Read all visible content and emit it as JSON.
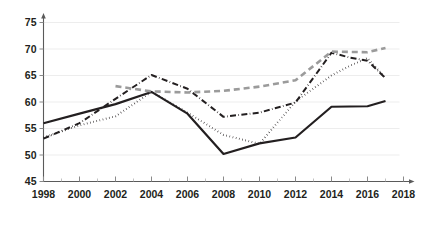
{
  "chart_data": {
    "type": "line",
    "title": "",
    "subtitle": "",
    "xlabel": "",
    "ylabel": "",
    "xlim": [
      1998,
      2018
    ],
    "ylim": [
      45,
      75
    ],
    "grid": false,
    "legend": "none",
    "x_ticks": [
      "1998",
      "2000",
      "2002",
      "2004",
      "2006",
      "2008",
      "2010",
      "2012",
      "2014",
      "2016",
      "2018"
    ],
    "x_tick_values": [
      1998,
      2000,
      2002,
      2004,
      2006,
      2008,
      2010,
      2012,
      2014,
      2016,
      2018
    ],
    "x_minor_tick_values": [
      1999,
      2001,
      2003,
      2005,
      2007,
      2009,
      2011,
      2013,
      2015,
      2017
    ],
    "y_ticks": [
      "45",
      "50",
      "55",
      "60",
      "65",
      "70",
      "75"
    ],
    "y_tick_values": [
      45,
      50,
      55,
      60,
      65,
      70,
      75
    ],
    "series": [
      {
        "name": "series-1-solid",
        "style": "solid",
        "color": "#231f20",
        "width": 2.2,
        "x": [
          1998,
          2000,
          2002,
          2004,
          2006,
          2008,
          2010,
          2012,
          2014,
          2016,
          2017
        ],
        "values": [
          56.0,
          57.8,
          59.6,
          61.9,
          57.8,
          50.2,
          52.2,
          53.3,
          59.1,
          59.2,
          60.2
        ]
      },
      {
        "name": "series-2-dash-dot",
        "style": "dash-dot",
        "color": "#231f20",
        "width": 2.0,
        "x": [
          1998,
          2000,
          2002,
          2004,
          2006,
          2008,
          2010,
          2012,
          2014,
          2015,
          2016,
          2017
        ],
        "values": [
          53.1,
          56.0,
          60.6,
          65.1,
          62.5,
          57.2,
          58.0,
          59.9,
          69.3,
          68.4,
          67.8,
          64.5
        ]
      },
      {
        "name": "series-3-dotted",
        "style": "dotted",
        "color": "#231f20",
        "width": 2.0,
        "x": [
          1998,
          2000,
          2002,
          2004,
          2006,
          2008,
          2010,
          2012,
          2014,
          2015,
          2016,
          2017
        ],
        "values": [
          53.3,
          55.6,
          57.3,
          61.9,
          58.0,
          53.8,
          52.1,
          60.1,
          65.0,
          66.8,
          68.3,
          64.5
        ]
      },
      {
        "name": "series-4-gray-dashed",
        "style": "dashed",
        "color": "#9b9b9b",
        "width": 2.6,
        "x": [
          2002,
          2004,
          2006,
          2008,
          2010,
          2012,
          2014,
          2016,
          2017
        ],
        "values": [
          63.0,
          62.0,
          61.8,
          62.1,
          62.9,
          64.1,
          69.5,
          69.4,
          70.2
        ]
      }
    ]
  }
}
